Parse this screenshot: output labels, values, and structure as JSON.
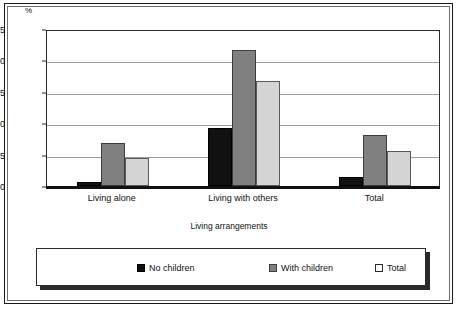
{
  "chart_data": {
    "type": "bar",
    "title": "",
    "subtitle": "",
    "xlabel": "Living arrangements",
    "ylabel": "%",
    "unit_label": "%",
    "categories": [
      "Living alone",
      "Living with others",
      "Total"
    ],
    "series": [
      {
        "name": "No children",
        "color": "#111111",
        "values": [
          0.6,
          9.3,
          1.5
        ]
      },
      {
        "name": "With children",
        "color": "#808080",
        "values": [
          6.9,
          21.6,
          8.2
        ]
      },
      {
        "name": "Total",
        "color": "#d4d4d4",
        "values": [
          4.5,
          16.8,
          5.6
        ]
      }
    ],
    "ylim": [
      0,
      25
    ],
    "yticks": [
      0,
      5,
      10,
      15,
      20,
      25
    ],
    "ytick_labels": [
      "0",
      "5",
      "10",
      "15",
      "20",
      "25"
    ],
    "grid": true,
    "grid_axis": "y",
    "legend_position": "bottom",
    "legend_entries": [
      "No children",
      "With children",
      "Total"
    ]
  }
}
